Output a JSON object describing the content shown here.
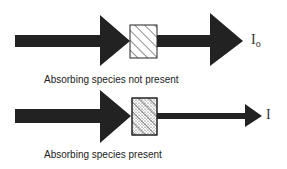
{
  "diagram": {
    "top": {
      "caption": "Absorbing species not present",
      "output_symbol": "I",
      "output_subscript": "o",
      "sample": "hatched cell (diagonal lines)"
    },
    "bottom": {
      "caption": "Absorbing species present",
      "output_symbol": "I",
      "sample": "hatched cell with dotted absorbing species"
    },
    "colors": {
      "arrow": "#222222",
      "background": "#ffffff"
    }
  }
}
